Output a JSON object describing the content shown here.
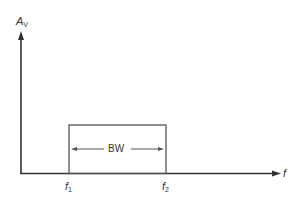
{
  "diagram": {
    "y_axis_label": {
      "main": "A",
      "sub": "V"
    },
    "x_axis_label": "f",
    "lower_cutoff": {
      "main": "f",
      "sub": "1"
    },
    "upper_cutoff": {
      "main": "f",
      "sub": "2"
    },
    "bandwidth_label": "BW",
    "colors": {
      "line": "#333333",
      "box": "#555555",
      "background": "#ffffff"
    }
  }
}
